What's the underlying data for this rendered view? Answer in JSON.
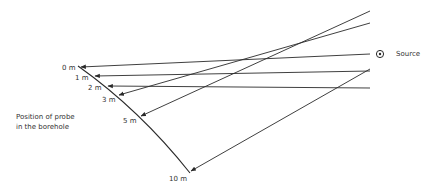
{
  "diagram": {
    "source_label": "Source",
    "caption_line1": "Position of probe",
    "caption_line2": "in the borehole",
    "depths": [
      {
        "label": "0 m",
        "x": 62,
        "y": 65
      },
      {
        "label": "1 m",
        "x": 74,
        "y": 74
      },
      {
        "label": "2 m",
        "x": 86,
        "y": 85
      },
      {
        "label": "3 m",
        "x": 102,
        "y": 96
      },
      {
        "label": "5 m",
        "x": 123,
        "y": 118
      },
      {
        "label": "10 m",
        "x": 170,
        "y": 174
      }
    ],
    "colors": {
      "line": "#2a2a2a",
      "background": "#ffffff"
    }
  }
}
